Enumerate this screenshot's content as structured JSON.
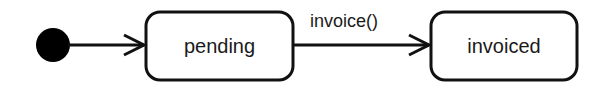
{
  "diagram": {
    "type": "UML state machine",
    "initial_state": {
      "label": ""
    },
    "states": [
      {
        "id": "pending",
        "label": "pending"
      },
      {
        "id": "invoiced",
        "label": "invoiced"
      }
    ],
    "transitions": [
      {
        "from": "initial",
        "to": "pending",
        "label": ""
      },
      {
        "from": "pending",
        "to": "invoiced",
        "label": "invoice()"
      }
    ],
    "colors": {
      "stroke": "#111111",
      "fill_initial": "#000000",
      "background": "#ffffff"
    }
  }
}
